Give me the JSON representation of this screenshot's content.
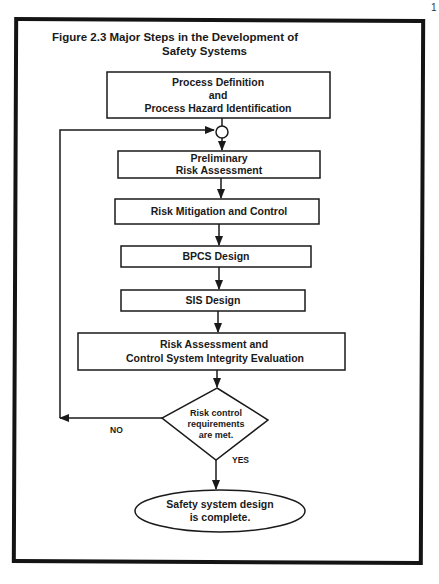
{
  "figure": {
    "title_line1": "Figure 2.3  Major Steps in the Development of",
    "title_line2": "Safety Systems"
  },
  "nodes": {
    "process_definition": {
      "line1": "Process Definition",
      "line2": "and",
      "line3": "Process Hazard Identification"
    },
    "preliminary_risk": {
      "line1": "Preliminary",
      "line2": "Risk  Assessment"
    },
    "risk_mitigation": {
      "line1": "Risk Mitigation and Control"
    },
    "bpcs_design": {
      "line1": "BPCS  Design"
    },
    "sis_design": {
      "line1": "SIS  Design"
    },
    "risk_assessment_integrity": {
      "line1": "Risk Assessment and",
      "line2": "Control System Integrity Evaluation"
    },
    "decision": {
      "line1": "Risk control",
      "line2": "requirements",
      "line3": "are met."
    },
    "end": {
      "line1": "Safety system design",
      "line2": "is complete."
    }
  },
  "edges": {
    "no_label": "NO",
    "yes_label": "YES"
  },
  "page_mark": "1"
}
